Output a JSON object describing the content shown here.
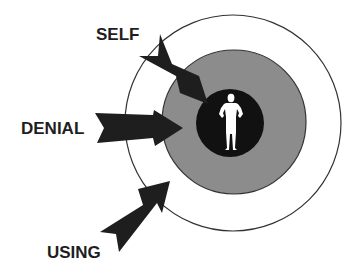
{
  "diagram": {
    "labels": {
      "self": "SELF",
      "denial": "DENIAL",
      "using": "USING"
    },
    "rings": [
      {
        "name": "outer-ring",
        "fill": "#ffffff",
        "stroke": "#333333"
      },
      {
        "name": "middle-ring",
        "fill": "#8c8c8c",
        "stroke": "#333333"
      },
      {
        "name": "inner-core",
        "fill": "#111111"
      }
    ],
    "figure": {
      "icon": "person-icon",
      "color": "#ffffff"
    },
    "arrow_color": "#1e1e1e"
  }
}
